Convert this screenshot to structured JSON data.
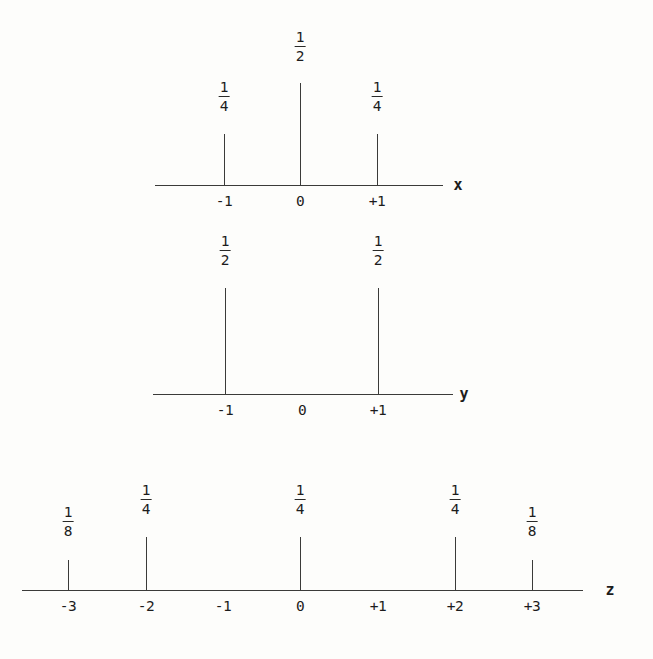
{
  "figure": {
    "background_color": "#fdfdfb",
    "ink_color": "#2a2a28",
    "caption": ""
  },
  "plots": [
    {
      "id": "plot-x",
      "axis_label": "x",
      "axis_y": 185,
      "axis_x_start": 155,
      "axis_x_end": 443,
      "axis_name_x": 458,
      "ticks": [
        {
          "label": "-1",
          "x": 224
        },
        {
          "label": "0",
          "x": 300
        },
        {
          "label": "+1",
          "x": 377
        }
      ],
      "stems": [
        {
          "x": 224,
          "top": 134,
          "value_num": "1",
          "value_den": "4",
          "fraction_y": 80
        },
        {
          "x": 300,
          "top": 83,
          "value_num": "1",
          "value_den": "2",
          "fraction_y": 30
        },
        {
          "x": 377,
          "top": 134,
          "value_num": "1",
          "value_den": "4",
          "fraction_y": 80
        }
      ]
    },
    {
      "id": "plot-y",
      "axis_label": "y",
      "axis_y": 394,
      "axis_x_start": 153,
      "axis_x_end": 453,
      "axis_name_x": 464,
      "ticks": [
        {
          "label": "-1",
          "x": 225
        },
        {
          "label": "0",
          "x": 302
        },
        {
          "label": "+1",
          "x": 378
        }
      ],
      "stems": [
        {
          "x": 225,
          "top": 288,
          "value_num": "1",
          "value_den": "2",
          "fraction_y": 234
        },
        {
          "x": 378,
          "top": 288,
          "value_num": "1",
          "value_den": "2",
          "fraction_y": 234
        }
      ]
    },
    {
      "id": "plot-z",
      "axis_label": "z",
      "axis_y": 590,
      "axis_x_start": 22,
      "axis_x_end": 583,
      "axis_name_x": 610,
      "ticks": [
        {
          "label": "-3",
          "x": 68
        },
        {
          "label": "-2",
          "x": 146
        },
        {
          "label": "-1",
          "x": 223
        },
        {
          "label": "0",
          "x": 300
        },
        {
          "label": "+1",
          "x": 378
        },
        {
          "label": "+2",
          "x": 455
        },
        {
          "label": "+3",
          "x": 532
        }
      ],
      "stems": [
        {
          "x": 68,
          "top": 560,
          "value_num": "1",
          "value_den": "8",
          "fraction_y": 505
        },
        {
          "x": 146,
          "top": 537,
          "value_num": "1",
          "value_den": "4",
          "fraction_y": 483
        },
        {
          "x": 300,
          "top": 537,
          "value_num": "1",
          "value_den": "4",
          "fraction_y": 483
        },
        {
          "x": 455,
          "top": 537,
          "value_num": "1",
          "value_den": "4",
          "fraction_y": 483
        },
        {
          "x": 532,
          "top": 560,
          "value_num": "1",
          "value_den": "8",
          "fraction_y": 505
        }
      ]
    }
  ],
  "chart_data": [
    {
      "type": "bar",
      "title": "",
      "xlabel": "x",
      "ylabel": "",
      "categories": [
        "-1",
        "0",
        "+1"
      ],
      "x": [
        -1,
        0,
        1
      ],
      "values": [
        0.25,
        0.5,
        0.25
      ],
      "value_labels": [
        "1/4",
        "1/2",
        "1/4"
      ],
      "xlim": [
        -1.9,
        1.9
      ],
      "ylim": [
        0,
        0.5
      ],
      "grid": false,
      "legend": false
    },
    {
      "type": "bar",
      "title": "",
      "xlabel": "y",
      "ylabel": "",
      "categories": [
        "-1",
        "0",
        "+1"
      ],
      "x": [
        -1,
        0,
        1
      ],
      "values": [
        0.5,
        0,
        0.5
      ],
      "value_labels": [
        "1/2",
        "",
        "1/2"
      ],
      "xlim": [
        -1.9,
        1.9
      ],
      "ylim": [
        0,
        0.5
      ],
      "grid": false,
      "legend": false
    },
    {
      "type": "bar",
      "title": "",
      "xlabel": "z",
      "ylabel": "",
      "categories": [
        "-3",
        "-2",
        "-1",
        "0",
        "+1",
        "+2",
        "+3"
      ],
      "x": [
        -3,
        -2,
        -1,
        0,
        1,
        2,
        3
      ],
      "values": [
        0.125,
        0.25,
        0,
        0.25,
        0,
        0.25,
        0.125
      ],
      "value_labels": [
        "1/8",
        "1/4",
        "",
        "1/4",
        "",
        "1/4",
        "1/8"
      ],
      "xlim": [
        -3.6,
        3.6
      ],
      "ylim": [
        0,
        0.25
      ],
      "grid": false,
      "legend": false
    }
  ]
}
